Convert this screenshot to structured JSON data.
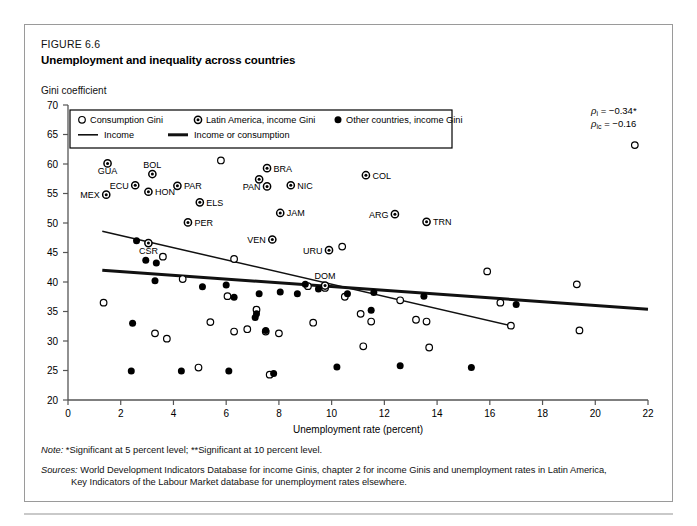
{
  "figure": {
    "number": "FIGURE 6.6",
    "title": "Unemployment and inequality across countries",
    "y_axis_caption": "Gini coefficient"
  },
  "annotations": {
    "rho_income": "ρi = −0.34*",
    "rho_income_consumption": "ρic = −0.16"
  },
  "notes": {
    "note_lead": "Note:",
    "note_text": "*Significant at 5 percent level; **Significant at 10 percent level.",
    "sources_lead": "Sources:",
    "sources_line1": "World Development Indicators Database for income Ginis, chapter 2 for income Ginis and unemployment rates in Latin America,",
    "sources_line2": "Key Indicators of the Labour Market database for unemployment rates elsewhere."
  },
  "chart_data": {
    "type": "scatter",
    "title": "Unemployment and inequality across countries",
    "xlabel": "Unemployment rate (percent)",
    "ylabel": "Gini coefficient",
    "xlim": [
      0,
      22
    ],
    "ylim": [
      20,
      70
    ],
    "xticks": [
      0,
      2,
      4,
      6,
      8,
      10,
      12,
      14,
      16,
      18,
      20,
      22
    ],
    "yticks": [
      20,
      25,
      30,
      35,
      40,
      45,
      50,
      55,
      60,
      65,
      70
    ],
    "grid": false,
    "legend_position": "top-left-inside",
    "legend": [
      {
        "marker": "open-circle",
        "label": "Consumption Gini"
      },
      {
        "marker": "dotted-circle",
        "label": "Latin America, income Gini"
      },
      {
        "marker": "filled-circle",
        "label": "Other countries, income Gini"
      },
      {
        "marker": "thin-line",
        "label": "Income"
      },
      {
        "marker": "thick-line",
        "label": "Income or consumption"
      }
    ],
    "trendlines": [
      {
        "name": "Income",
        "style": "thin",
        "points": [
          [
            1.3,
            48.6
          ],
          [
            16.8,
            32.6
          ]
        ]
      },
      {
        "name": "Income or consumption",
        "style": "thick",
        "points": [
          [
            1.3,
            42.0
          ],
          [
            22.0,
            35.4
          ]
        ]
      }
    ],
    "series": [
      {
        "name": "Latin America, income Gini",
        "marker": "dotted-circle",
        "points": [
          {
            "x": 1.5,
            "y": 60.1,
            "label": "GUA",
            "label_pos": "below"
          },
          {
            "x": 3.2,
            "y": 58.3,
            "label": "BOL",
            "label_pos": "above"
          },
          {
            "x": 2.55,
            "y": 56.4,
            "label": "ECU",
            "label_pos": "left"
          },
          {
            "x": 3.05,
            "y": 55.3,
            "label": "HON",
            "label_pos": "right"
          },
          {
            "x": 1.45,
            "y": 54.8,
            "label": "MEX",
            "label_pos": "left"
          },
          {
            "x": 4.15,
            "y": 56.3,
            "label": "PAR",
            "label_pos": "right"
          },
          {
            "x": 7.55,
            "y": 59.3,
            "label": "BRA",
            "label_pos": "right"
          },
          {
            "x": 7.25,
            "y": 57.4,
            "label": "",
            "label_pos": "none"
          },
          {
            "x": 7.55,
            "y": 56.2,
            "label": "PAN",
            "label_pos": "left"
          },
          {
            "x": 8.45,
            "y": 56.4,
            "label": "NIC",
            "label_pos": "right"
          },
          {
            "x": 5.0,
            "y": 53.5,
            "label": "ELS",
            "label_pos": "right"
          },
          {
            "x": 8.05,
            "y": 51.7,
            "label": "JAM",
            "label_pos": "right"
          },
          {
            "x": 4.55,
            "y": 50.1,
            "label": "PER",
            "label_pos": "right"
          },
          {
            "x": 7.75,
            "y": 47.2,
            "label": "VEN",
            "label_pos": "left"
          },
          {
            "x": 11.3,
            "y": 58.1,
            "label": "COL",
            "label_pos": "right"
          },
          {
            "x": 12.4,
            "y": 51.5,
            "label": "ARG",
            "label_pos": "left"
          },
          {
            "x": 13.6,
            "y": 50.2,
            "label": "TRN",
            "label_pos": "right"
          },
          {
            "x": 3.05,
            "y": 46.6,
            "label": "CSR",
            "label_pos": "below"
          },
          {
            "x": 9.9,
            "y": 45.4,
            "label": "URU",
            "label_pos": "left"
          },
          {
            "x": 9.75,
            "y": 39.4,
            "label": "DOM",
            "label_pos": "above"
          }
        ]
      },
      {
        "name": "Consumption Gini",
        "marker": "open-circle",
        "points": [
          {
            "x": 5.8,
            "y": 60.6
          },
          {
            "x": 10.4,
            "y": 46.0
          },
          {
            "x": 21.5,
            "y": 63.2
          },
          {
            "x": 3.6,
            "y": 44.3
          },
          {
            "x": 6.3,
            "y": 43.9
          },
          {
            "x": 1.35,
            "y": 36.5
          },
          {
            "x": 4.35,
            "y": 40.5
          },
          {
            "x": 5.4,
            "y": 33.2
          },
          {
            "x": 6.3,
            "y": 31.6
          },
          {
            "x": 6.8,
            "y": 32.0
          },
          {
            "x": 7.5,
            "y": 31.6
          },
          {
            "x": 8.0,
            "y": 31.3
          },
          {
            "x": 3.3,
            "y": 31.3
          },
          {
            "x": 3.75,
            "y": 30.4
          },
          {
            "x": 4.95,
            "y": 25.5
          },
          {
            "x": 9.1,
            "y": 39.3
          },
          {
            "x": 9.75,
            "y": 39.0
          },
          {
            "x": 7.65,
            "y": 24.3
          },
          {
            "x": 6.05,
            "y": 37.6
          },
          {
            "x": 7.15,
            "y": 35.3
          },
          {
            "x": 10.5,
            "y": 37.5
          },
          {
            "x": 11.1,
            "y": 34.6
          },
          {
            "x": 12.6,
            "y": 36.9
          },
          {
            "x": 11.5,
            "y": 33.3
          },
          {
            "x": 13.2,
            "y": 33.6
          },
          {
            "x": 13.6,
            "y": 33.3
          },
          {
            "x": 11.2,
            "y": 29.1
          },
          {
            "x": 13.7,
            "y": 28.9
          },
          {
            "x": 15.9,
            "y": 41.8
          },
          {
            "x": 16.4,
            "y": 36.5
          },
          {
            "x": 16.8,
            "y": 32.6
          },
          {
            "x": 19.3,
            "y": 39.6
          },
          {
            "x": 19.4,
            "y": 31.8
          },
          {
            "x": 9.3,
            "y": 33.1
          }
        ]
      },
      {
        "name": "Other countries, income Gini",
        "marker": "filled-circle",
        "points": [
          {
            "x": 2.6,
            "y": 47.0
          },
          {
            "x": 2.95,
            "y": 43.7
          },
          {
            "x": 3.35,
            "y": 43.2
          },
          {
            "x": 3.3,
            "y": 40.2
          },
          {
            "x": 2.45,
            "y": 33.0
          },
          {
            "x": 2.4,
            "y": 24.9
          },
          {
            "x": 4.3,
            "y": 24.9
          },
          {
            "x": 6.0,
            "y": 39.5
          },
          {
            "x": 6.3,
            "y": 37.4
          },
          {
            "x": 7.25,
            "y": 38.0
          },
          {
            "x": 7.15,
            "y": 34.6
          },
          {
            "x": 7.1,
            "y": 34.0
          },
          {
            "x": 7.5,
            "y": 31.8
          },
          {
            "x": 8.05,
            "y": 38.3
          },
          {
            "x": 7.8,
            "y": 24.5
          },
          {
            "x": 8.7,
            "y": 38.0
          },
          {
            "x": 9.5,
            "y": 38.8
          },
          {
            "x": 10.6,
            "y": 38.0
          },
          {
            "x": 11.6,
            "y": 38.2
          },
          {
            "x": 11.5,
            "y": 35.2
          },
          {
            "x": 12.6,
            "y": 25.8
          },
          {
            "x": 6.1,
            "y": 24.9
          },
          {
            "x": 9.0,
            "y": 39.6
          },
          {
            "x": 10.2,
            "y": 25.6
          },
          {
            "x": 15.3,
            "y": 25.5
          },
          {
            "x": 13.5,
            "y": 37.6
          },
          {
            "x": 17.0,
            "y": 36.2
          },
          {
            "x": 5.1,
            "y": 39.2
          }
        ]
      }
    ]
  }
}
